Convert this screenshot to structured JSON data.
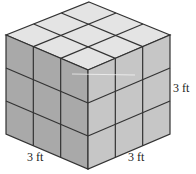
{
  "figure": {
    "type": "3x3x3 cube of unit cubes",
    "grid": 3,
    "colors": {
      "top": "#e4e4e4",
      "left": "#a9a9a9",
      "right": "#c6c6c6",
      "lines": "#333333"
    }
  },
  "labels": {
    "right_edge": "3 ft",
    "bottom_left_edge": "3 ft",
    "bottom_right_edge": "3 ft"
  }
}
